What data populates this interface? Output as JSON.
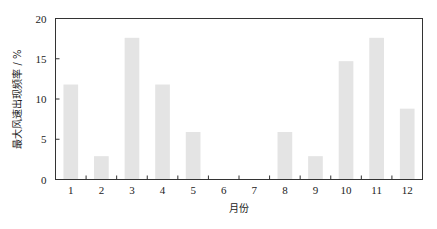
{
  "chart_data": {
    "type": "bar",
    "title": "",
    "xlabel": "月份",
    "ylabel": "最大风速出现频率 / %",
    "categories": [
      "1",
      "2",
      "3",
      "4",
      "5",
      "6",
      "7",
      "8",
      "9",
      "10",
      "11",
      "12"
    ],
    "values": [
      11.8,
      2.9,
      17.6,
      11.8,
      5.9,
      0,
      0,
      5.9,
      2.9,
      14.7,
      17.6,
      8.8
    ],
    "ylim": [
      0,
      20
    ],
    "yticks": [
      0,
      5,
      10,
      15,
      20
    ],
    "grid": false,
    "legend": null,
    "bar_color": "#e4e4e4",
    "axis_color": "#333333"
  }
}
